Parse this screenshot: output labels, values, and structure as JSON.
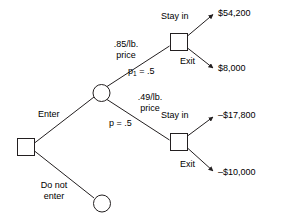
{
  "diagram": {
    "type": "decision-tree",
    "title": "",
    "nodes": {
      "root_decision": {
        "shape": "square",
        "label": ""
      },
      "chance": {
        "shape": "circle",
        "label": ""
      },
      "do_not_enter_terminal": {
        "shape": "circle",
        "label": ""
      },
      "upper_decision": {
        "shape": "square",
        "label": ""
      },
      "lower_decision": {
        "shape": "square",
        "label": ""
      }
    },
    "branches": {
      "enter": "Enter",
      "do_not_enter_line1": "Do not",
      "do_not_enter_line2": "enter",
      "upper_price_line1": ".85/lb.",
      "upper_price_line2": "price",
      "upper_prob_p": "p",
      "upper_prob_sub": "1",
      "upper_prob_value": " = .5",
      "lower_price_line1": ".49/lb.",
      "lower_price_line2": "price",
      "lower_prob": "p = .5",
      "upper_stay_in": "Stay in",
      "upper_exit": "Exit",
      "lower_stay_in": "Stay in",
      "lower_exit": "Exit"
    },
    "payoffs": {
      "upper_stay_in_value": "$54,200",
      "upper_exit_value": "$8,000",
      "lower_stay_in_value": "–$17,800",
      "lower_exit_value": "–$10,000"
    },
    "colors": {
      "stroke": "#231f20",
      "text": "#000000",
      "background": "#ffffff"
    }
  }
}
